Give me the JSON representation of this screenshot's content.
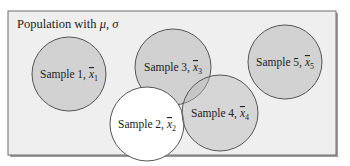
{
  "population": {
    "label": "Population with ",
    "mu": "μ",
    "sep": ", ",
    "sigma": "σ",
    "box_fill": "#efefef",
    "border_color": "#6e6e6e"
  },
  "samples": [
    {
      "id": 1,
      "prefix": "Sample 1, ",
      "var": "x",
      "bar": "‾",
      "sub": "1",
      "cx": 69,
      "cy": 74,
      "r": 37,
      "fill": "#d2d2d2",
      "opacity": 1.0
    },
    {
      "id": 3,
      "prefix": "Sample 3, ",
      "var": "x",
      "bar": "‾",
      "sub": "3",
      "cx": 173,
      "cy": 67,
      "r": 38,
      "fill": "#b8b8b8",
      "opacity": 0.55
    },
    {
      "id": 5,
      "prefix": "Sample 5, ",
      "var": "x",
      "bar": "‾",
      "sub": "5",
      "cx": 285,
      "cy": 62,
      "r": 37,
      "fill": "#d2d2d2",
      "opacity": 1.0
    },
    {
      "id": 2,
      "prefix": "Sample 2, ",
      "var": "x",
      "bar": "‾",
      "sub": "2",
      "cx": 147,
      "cy": 124,
      "r": 37,
      "fill": "#ffffff",
      "opacity": 1.0
    },
    {
      "id": 4,
      "prefix": "Sample 4, ",
      "var": "x",
      "bar": "‾",
      "sub": "4",
      "cx": 220,
      "cy": 113,
      "r": 38,
      "fill": "#b8b8b8",
      "opacity": 0.45
    }
  ],
  "stroke_color": "#555555"
}
